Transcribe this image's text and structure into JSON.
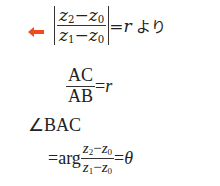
{
  "arrow_color": "#f04a1e",
  "line1": {
    "num": {
      "a": "z",
      "a_sub": "2",
      "minus": "−",
      "b": "z",
      "b_sub": "0"
    },
    "den": {
      "a": "z",
      "a_sub": "1",
      "minus": "−",
      "b": "z",
      "b_sub": "0"
    },
    "eq": "=",
    "rhs": "r",
    "suffix": "より"
  },
  "line2": {
    "num": "AC",
    "den": "AB",
    "eq": "=",
    "rhs": "r"
  },
  "line3": {
    "text": "∠BAC"
  },
  "line4": {
    "eq": "=",
    "func": "arg",
    "num": {
      "a": "z",
      "a_sub": "2",
      "minus": "−",
      "b": "z",
      "b_sub": "0"
    },
    "den": {
      "a": "z",
      "a_sub": "1",
      "minus": "−",
      "b": "z",
      "b_sub": "0"
    },
    "eq2": "=",
    "rhs": "θ"
  }
}
